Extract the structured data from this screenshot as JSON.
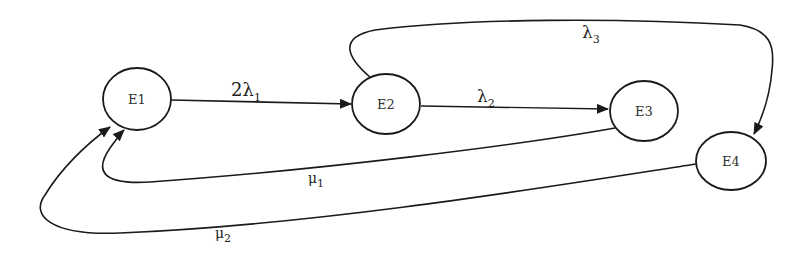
{
  "diagram": {
    "type": "state-transition",
    "nodes": [
      {
        "id": "E1",
        "label": "E1",
        "cx": 137,
        "cy": 99,
        "rx": 34,
        "ry": 31
      },
      {
        "id": "E2",
        "label": "E2",
        "cx": 386,
        "cy": 104,
        "rx": 34,
        "ry": 30
      },
      {
        "id": "E3",
        "label": "E3",
        "cx": 644,
        "cy": 111,
        "rx": 34,
        "ry": 30
      },
      {
        "id": "E4",
        "label": "E4",
        "cx": 731,
        "cy": 161,
        "rx": 35,
        "ry": 29
      }
    ],
    "edges": [
      {
        "from": "E1",
        "to": "E2",
        "label_main": "2λ",
        "label_sub": "1"
      },
      {
        "from": "E2",
        "to": "E3",
        "label_main": "λ",
        "label_sub": "2"
      },
      {
        "from": "E2",
        "to": "E4",
        "label_main": "λ",
        "label_sub": "3"
      },
      {
        "from": "E3",
        "to": "E1",
        "label_main": "μ",
        "label_sub": "1"
      },
      {
        "from": "E4",
        "to": "E1",
        "label_main": "μ",
        "label_sub": "2"
      }
    ],
    "stroke_color": "#1a1a1a"
  }
}
